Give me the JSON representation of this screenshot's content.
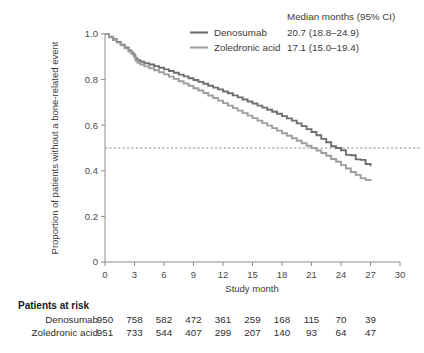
{
  "figure": {
    "background": "#ffffff"
  },
  "legend": {
    "header": "Median months (95% CI)",
    "entries": [
      {
        "label": "Denosumab",
        "value": "20.7 (18.8–24.9)",
        "color": "#6e6e6e"
      },
      {
        "label": "Zoledronic acid",
        "value": "17.1 (15.0–19.4)",
        "color": "#9d9d9d"
      }
    ]
  },
  "risk_table": {
    "title": "Patients at risk",
    "rows": [
      {
        "label": "Denosumab",
        "values": [
          "950",
          "758",
          "582",
          "472",
          "361",
          "259",
          "168",
          "115",
          "70",
          "39"
        ]
      },
      {
        "label": "Zoledronic acid",
        "values": [
          "951",
          "733",
          "544",
          "407",
          "299",
          "207",
          "140",
          "93",
          "64",
          "47"
        ]
      }
    ]
  },
  "chart_data": {
    "type": "line",
    "title": "",
    "xlabel": "Study month",
    "ylabel": "Proportion of patients without a bone-related event",
    "xlim": [
      0,
      30
    ],
    "ylim": [
      0,
      1.0
    ],
    "xticks": [
      0,
      3,
      6,
      9,
      12,
      15,
      18,
      21,
      24,
      27,
      30
    ],
    "xticklabels": [
      "0",
      "3",
      "6",
      "9",
      "12",
      "15",
      "18",
      "21",
      "24",
      "27",
      "30"
    ],
    "yticks": [
      0,
      0.2,
      0.4,
      0.6,
      0.8,
      1.0
    ],
    "yticklabels": [
      "0",
      "0.2",
      "0.4",
      "0.6",
      "0.8",
      "1.0"
    ],
    "grid": false,
    "legend_position": "top-right",
    "reference_line": {
      "axis": "y",
      "value": 0.5,
      "style": "dashed",
      "color": "#8d8d8d"
    },
    "series": [
      {
        "name": "Denosumab",
        "color": "#6e6e6e",
        "median_months": 20.7,
        "ci_low": 18.8,
        "ci_high": 24.9,
        "x": [
          0.0,
          0.4,
          0.8,
          1.2,
          1.6,
          2.0,
          2.4,
          2.7,
          2.9,
          3.0,
          3.1,
          3.3,
          3.6,
          4.0,
          4.5,
          5.0,
          5.5,
          6.0,
          6.5,
          7.0,
          7.5,
          8.0,
          8.5,
          9.0,
          9.5,
          10.0,
          10.5,
          11.0,
          11.5,
          12.0,
          12.5,
          13.0,
          13.5,
          14.0,
          14.5,
          15.0,
          15.5,
          16.0,
          16.5,
          17.0,
          17.5,
          18.0,
          18.5,
          19.0,
          19.5,
          20.0,
          20.5,
          21.0,
          21.5,
          22.0,
          22.5,
          23.0,
          23.5,
          24.0,
          24.5,
          25.0,
          25.5,
          26.0,
          26.5,
          27.0
        ],
        "y": [
          1.0,
          0.988,
          0.977,
          0.965,
          0.953,
          0.941,
          0.928,
          0.918,
          0.912,
          0.905,
          0.893,
          0.885,
          0.878,
          0.872,
          0.866,
          0.859,
          0.852,
          0.845,
          0.838,
          0.83,
          0.822,
          0.814,
          0.806,
          0.798,
          0.79,
          0.782,
          0.773,
          0.765,
          0.757,
          0.748,
          0.74,
          0.731,
          0.722,
          0.713,
          0.704,
          0.695,
          0.686,
          0.677,
          0.668,
          0.659,
          0.65,
          0.64,
          0.63,
          0.62,
          0.608,
          0.596,
          0.583,
          0.57,
          0.556,
          0.54,
          0.525,
          0.508,
          0.5,
          0.49,
          0.47,
          0.468,
          0.45,
          0.448,
          0.43,
          0.42
        ]
      },
      {
        "name": "Zoledronic acid",
        "color": "#9d9d9d",
        "median_months": 17.1,
        "ci_low": 15.0,
        "ci_high": 19.4,
        "x": [
          0.0,
          0.4,
          0.8,
          1.2,
          1.6,
          2.0,
          2.4,
          2.7,
          2.9,
          3.0,
          3.1,
          3.3,
          3.6,
          4.0,
          4.5,
          5.0,
          5.5,
          6.0,
          6.5,
          7.0,
          7.5,
          8.0,
          8.5,
          9.0,
          9.5,
          10.0,
          10.5,
          11.0,
          11.5,
          12.0,
          12.5,
          13.0,
          13.5,
          14.0,
          14.5,
          15.0,
          15.5,
          16.0,
          16.5,
          17.0,
          17.5,
          18.0,
          18.5,
          19.0,
          19.5,
          20.0,
          20.5,
          21.0,
          21.5,
          22.0,
          22.5,
          23.0,
          23.5,
          24.0,
          24.5,
          25.0,
          25.5,
          26.0,
          26.5,
          27.0
        ],
        "y": [
          1.0,
          0.986,
          0.974,
          0.962,
          0.95,
          0.937,
          0.923,
          0.912,
          0.905,
          0.898,
          0.884,
          0.874,
          0.866,
          0.858,
          0.85,
          0.841,
          0.832,
          0.823,
          0.813,
          0.803,
          0.793,
          0.783,
          0.773,
          0.762,
          0.752,
          0.741,
          0.73,
          0.719,
          0.708,
          0.697,
          0.686,
          0.675,
          0.664,
          0.653,
          0.642,
          0.631,
          0.62,
          0.609,
          0.598,
          0.587,
          0.576,
          0.565,
          0.554,
          0.543,
          0.532,
          0.521,
          0.51,
          0.5,
          0.489,
          0.478,
          0.466,
          0.452,
          0.44,
          0.425,
          0.41,
          0.395,
          0.382,
          0.368,
          0.36,
          0.355
        ]
      }
    ]
  }
}
